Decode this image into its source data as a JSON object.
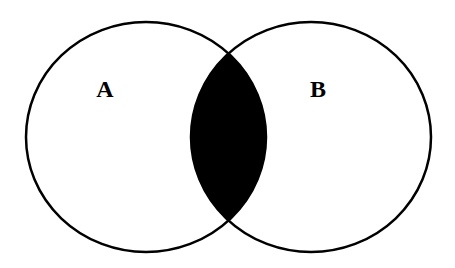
{
  "diagram": {
    "type": "venn",
    "sets": [
      {
        "label": "A",
        "cx": 146,
        "cy": 137,
        "rx": 120,
        "ry": 115,
        "label_x": 105,
        "label_y": 97
      },
      {
        "label": "B",
        "cx": 311,
        "cy": 137,
        "rx": 120,
        "ry": 115,
        "label_x": 318,
        "label_y": 97
      }
    ],
    "shaded_region": "A ∩ B",
    "colors": {
      "stroke": "#000000",
      "fill_shaded": "#000000",
      "background": "#ffffff"
    }
  }
}
